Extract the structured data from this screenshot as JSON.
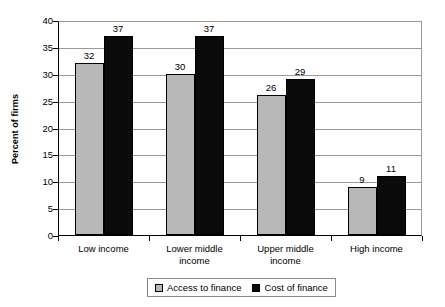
{
  "chart_data": {
    "type": "bar",
    "title": "",
    "subtitle": "",
    "xlabel": "",
    "ylabel": "Percent of firms",
    "ylim": [
      0,
      40
    ],
    "yticks": [
      0,
      5,
      10,
      15,
      20,
      25,
      30,
      35,
      40
    ],
    "ytick_labels": [
      "0",
      "5",
      "10",
      "15",
      "20",
      "25",
      "30",
      "35",
      "40"
    ],
    "grid": true,
    "grid_axis": "y",
    "legend_position": "bottom-center",
    "categories": [
      "Low income",
      "Lower middle income",
      "Upper middle income",
      "High income"
    ],
    "category_lines": [
      [
        "Low income"
      ],
      [
        "Lower middle",
        "income"
      ],
      [
        "Upper middle",
        "income"
      ],
      [
        "High income"
      ]
    ],
    "series": [
      {
        "name": "Access to finance",
        "color": "#b8b8b8",
        "values": [
          32,
          30,
          26,
          9
        ],
        "labels": [
          "32",
          "30",
          "26",
          "9"
        ]
      },
      {
        "name": "Cost of finance",
        "color": "#0a0a0a",
        "values": [
          37,
          37,
          29,
          11
        ],
        "labels": [
          "37",
          "37",
          "29",
          "11"
        ]
      }
    ]
  },
  "axes": {
    "y_title": "Percent of firms"
  },
  "legend": {
    "entries": [
      {
        "label": "Access to finance",
        "color": "#b8b8b8"
      },
      {
        "label": "Cost of finance",
        "color": "#0a0a0a"
      }
    ]
  },
  "colors": {
    "series_access": "#b8b8b8",
    "series_cost": "#0a0a0a",
    "axis": "#000000",
    "gridline": "#9a9a9a",
    "background": "#ffffff",
    "text": "#000000"
  }
}
